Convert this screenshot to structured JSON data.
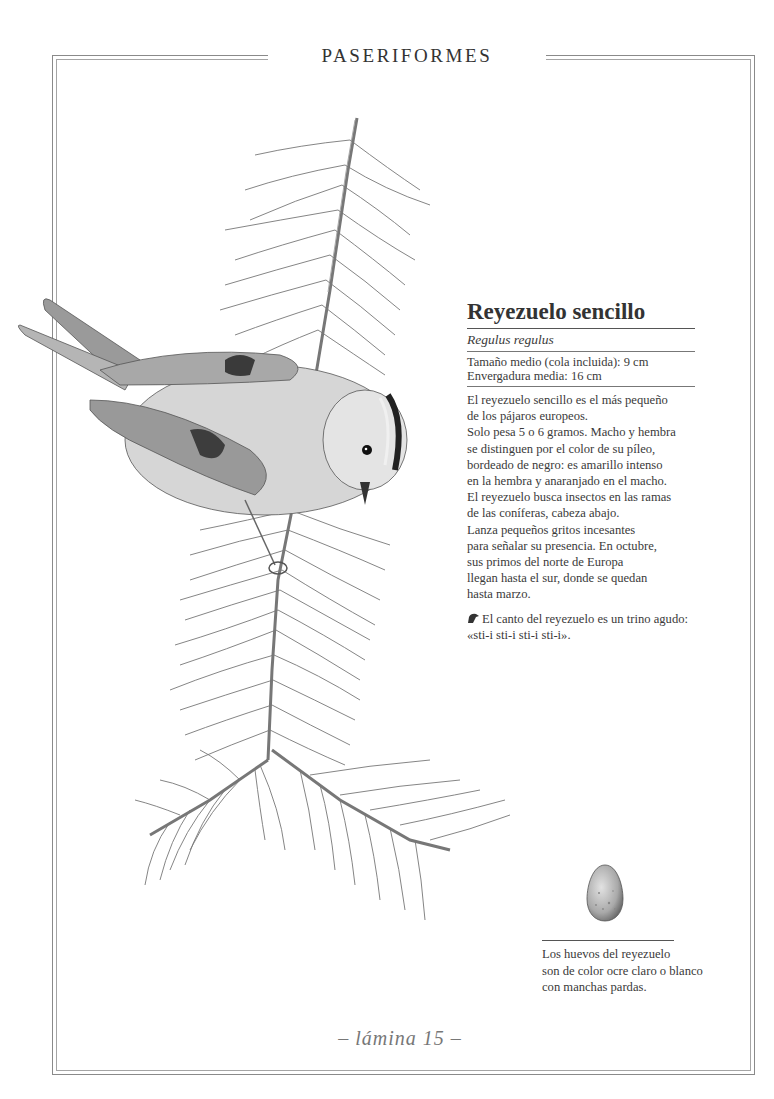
{
  "page": {
    "section_title": "PASERIFORMES",
    "plate_label": "– lámina 15 –"
  },
  "species": {
    "common_name": "Reyezuelo sencillo",
    "scientific_name": "Regulus regulus",
    "measurements": [
      "Tamaño medio (cola incluida): 9 cm",
      "Envergadura media: 16 cm"
    ],
    "description_lines": [
      "El reyezuelo sencillo es el más pequeño",
      "de los pájaros europeos.",
      "Solo pesa 5 o 6 gramos. Macho y hembra",
      "se distinguen por el color de su píleo,",
      "bordeado de negro: es amarillo intenso",
      "en la hembra y anaranjado en el macho.",
      "El reyezuelo busca insectos en las ramas",
      "de las coníferas, cabeza abajo.",
      "Lanza pequeños gritos incesantes",
      "para señalar su presencia. En octubre,",
      "sus primos del norte de Europa",
      "llegan hasta el sur, donde se quedan",
      "hasta marzo."
    ],
    "song_icon": "bird-head-icon",
    "song_lines": [
      "El canto del reyezuelo es un trino agudo:",
      "«sti-i sti-i sti-i sti-i»."
    ]
  },
  "egg": {
    "caption_lines": [
      "Los huevos del reyezuelo",
      "son de color ocre claro o blanco",
      "con manchas pardas."
    ]
  },
  "colors": {
    "text": "#3a3a3a",
    "frame": "#8a8a8a",
    "plate_label": "#777777"
  }
}
